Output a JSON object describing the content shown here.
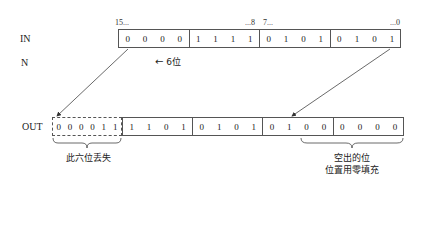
{
  "labels": {
    "in": "IN",
    "n": "N",
    "out": "OUT"
  },
  "bit_markers": {
    "msb": "15...",
    "high_byte_end": "...8",
    "low_byte_start": "7...",
    "lsb": "...0"
  },
  "shift": {
    "arrow": "←",
    "text": "6位"
  },
  "in_bits": [
    [
      "0",
      "0",
      "0",
      "0"
    ],
    [
      "1",
      "1",
      "1",
      "1"
    ],
    [
      "0",
      "1",
      "0",
      "1"
    ],
    [
      "0",
      "1",
      "0",
      "1"
    ]
  ],
  "out_lost_bits": [
    "0",
    "0",
    "0",
    "0",
    "1",
    "1"
  ],
  "out_bits": [
    [
      "1",
      "1",
      "0",
      "1"
    ],
    [
      "0",
      "1",
      "0",
      "1"
    ],
    [
      "0",
      "1",
      "0",
      "0"
    ],
    [
      "0",
      "0",
      "0",
      "0"
    ]
  ],
  "captions": {
    "lost": "此六位丢失",
    "filled_line1": "空出的位",
    "filled_line2": "位置用零填充"
  },
  "colors": {
    "line": "#555555",
    "text": "#222222"
  }
}
